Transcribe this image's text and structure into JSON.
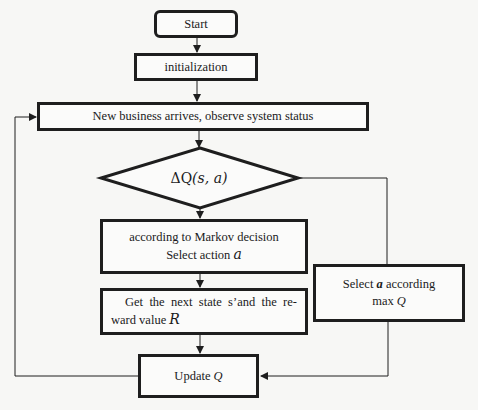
{
  "diagram": {
    "type": "flowchart",
    "nodes": {
      "start": {
        "label": "Start",
        "shape": "rounded-rect"
      },
      "init": {
        "label": "initialization",
        "shape": "rect"
      },
      "observe": {
        "label": "New business arrives, observe system status",
        "shape": "rect"
      },
      "decision": {
        "label_prefix": "ΔQ",
        "label_args": "(s, a)",
        "label": "ΔQ(s, a)",
        "shape": "diamond"
      },
      "markov": {
        "line1": "according to Markov decision",
        "line2_text": "Select action ",
        "line2_var": "a",
        "shape": "rect"
      },
      "next_state": {
        "line1": "Get the next state s’and the re-",
        "line2_text": "ward value ",
        "line2_var": "R",
        "shape": "rect"
      },
      "select_max": {
        "line1_pre": "Select ",
        "line1_var": "a",
        "line1_post": " according",
        "line2_text": "max ",
        "line2_var": "Q",
        "shape": "rect"
      },
      "update": {
        "label_text": "Update ",
        "label_var": "Q",
        "shape": "rect"
      }
    },
    "edges": [
      {
        "from": "start",
        "to": "init"
      },
      {
        "from": "init",
        "to": "observe"
      },
      {
        "from": "observe",
        "to": "decision"
      },
      {
        "from": "decision",
        "to": "markov"
      },
      {
        "from": "decision",
        "to": "select_max"
      },
      {
        "from": "markov",
        "to": "next_state"
      },
      {
        "from": "next_state",
        "to": "update"
      },
      {
        "from": "select_max",
        "to": "update"
      },
      {
        "from": "update",
        "to": "observe"
      }
    ],
    "colors": {
      "stroke": "#1e1e1e",
      "background": "#f7f7f5"
    }
  }
}
